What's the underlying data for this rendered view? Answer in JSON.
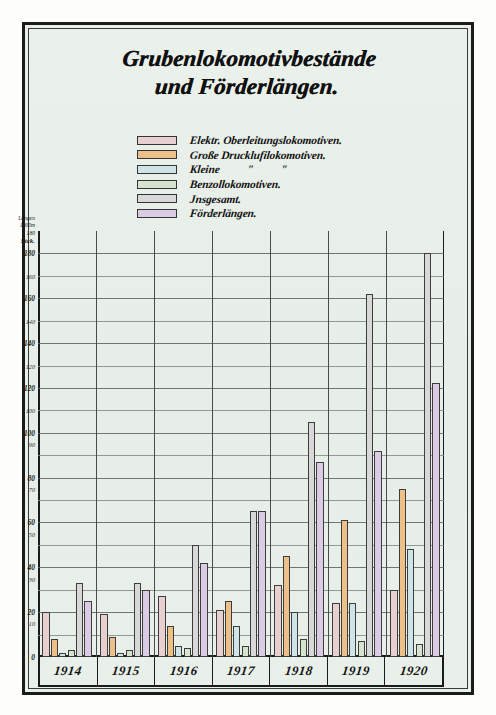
{
  "title": {
    "line1": "Grubenlokomotivbestände",
    "line2": "und Förderlängen."
  },
  "legend": [
    {
      "label": "Elektr. Oberleitungslokomotiven.",
      "color": "#e8cfd0"
    },
    {
      "label": "Große Drucklufilokomotiven.",
      "color": "#edc08a"
    },
    {
      "label": "Kleine          \"          \"",
      "color": "#cfe4e6"
    },
    {
      "label": "Benzollokomotiven.",
      "color": "#d6e4cf"
    },
    {
      "label": "Jnsgesamt.",
      "color": "#d8d8d8"
    },
    {
      "label": "Förderlängen.",
      "color": "#dccbe4"
    }
  ],
  "axis": {
    "unit_top_1": "Längen",
    "unit_top_2": "1000m",
    "unit_top_3": "180",
    "unit_count": "Stck.",
    "count_ticks": [
      "180",
      "160",
      "140",
      "120",
      "100",
      "80",
      "60",
      "40",
      "20",
      "0"
    ],
    "length_ticks": [
      "160",
      "140",
      "120",
      "100",
      "90",
      "70",
      "50",
      "30",
      "10"
    ]
  },
  "chart_data": {
    "type": "bar",
    "title": "Grubenlokomotivbestände und Förderlängen.",
    "xlabel": "",
    "ylabel": "Stck. / Längen 1000m",
    "grid": true,
    "legend_position": "top-center",
    "ylim": [
      0,
      190
    ],
    "categories": [
      "1914",
      "1915",
      "1916",
      "1917",
      "1918",
      "1919",
      "1920"
    ],
    "series": [
      {
        "name": "Elektr. Oberleitungslokomotiven.",
        "color": "#e8cfd0",
        "values": [
          20,
          19,
          27,
          21,
          32,
          24,
          30
        ]
      },
      {
        "name": "Große Drucklufilokomotiven.",
        "color": "#edc08a",
        "values": [
          8,
          9,
          14,
          25,
          45,
          61,
          75
        ]
      },
      {
        "name": "Kleine \" \"",
        "color": "#cfe4e6",
        "values": [
          2,
          2,
          5,
          14,
          20,
          24,
          48
        ]
      },
      {
        "name": "Benzollokomotiven.",
        "color": "#d6e4cf",
        "values": [
          3,
          3,
          4,
          5,
          8,
          7,
          6
        ]
      },
      {
        "name": "Jnsgesamt.",
        "color": "#d8d8d8",
        "values": [
          33,
          33,
          50,
          65,
          105,
          162,
          180
        ]
      },
      {
        "name": "Förderlängen.",
        "color": "#dccbe4",
        "values": [
          25,
          30,
          42,
          65,
          87,
          92,
          122
        ]
      }
    ]
  },
  "years": [
    "1914",
    "1915",
    "1916",
    "1917",
    "1918",
    "1919",
    "1920"
  ]
}
